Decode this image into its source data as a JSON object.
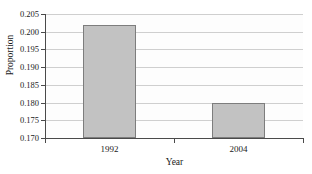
{
  "chart_data": {
    "type": "bar",
    "title": "",
    "categories": [
      "1992",
      "2004"
    ],
    "values": [
      0.202,
      0.18
    ],
    "xlabel": "Year",
    "ylabel": "Proportion",
    "ylim": [
      0.17,
      0.205
    ],
    "ytick_labels": [
      "0.205",
      "0.200",
      "0.195",
      "0.190",
      "0.185",
      "0.180",
      "0.175",
      "0.170"
    ],
    "ytick_values": [
      0.205,
      0.2,
      0.195,
      0.19,
      0.185,
      0.18,
      0.175,
      0.17
    ],
    "grid": true,
    "legend": false,
    "legend_position": "none",
    "bar_fill_color": "#c2c2c2",
    "bar_border_color": "#7d7d7d",
    "gridline_color": "#cfcfcf",
    "axis_color": "#4a4a4a",
    "background_color": "#ffffff"
  }
}
